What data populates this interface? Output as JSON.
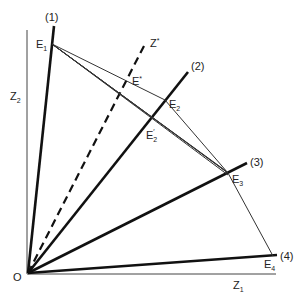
{
  "diagram": {
    "origin_label": "O",
    "axes": {
      "z1_label": "Z",
      "z1_sub": "1",
      "z2_label": "Z",
      "z2_sub": "2"
    },
    "rays": [
      {
        "label": "(1)",
        "end": [
          54,
          26
        ]
      },
      {
        "label": "(2)",
        "end": [
          188,
          72
        ]
      },
      {
        "label": "(3)",
        "end": [
          247,
          163
        ]
      },
      {
        "label": "(4)",
        "end": [
          277,
          255
        ]
      }
    ],
    "dashed_ray": {
      "label": "Z",
      "sup": "*",
      "end": [
        146,
        42
      ]
    },
    "points": {
      "E1": {
        "label": "E",
        "sub": "1",
        "xy": [
          52,
          44
        ]
      },
      "E2": {
        "label": "E",
        "sub": "2",
        "xy": [
          165,
          100
        ]
      },
      "E2prime": {
        "label": "E",
        "sub": "2",
        "prime": "′",
        "xy": [
          147,
          120
        ]
      },
      "E3": {
        "label": "E",
        "sub": "3",
        "xy": [
          228,
          173
        ]
      },
      "E4": {
        "label": "E",
        "sub": "4",
        "xy": [
          273,
          256
        ]
      },
      "Estar": {
        "label": "E",
        "sup": "*",
        "xy": [
          127,
          80
        ]
      }
    },
    "origin": [
      28,
      273
    ],
    "colors": {
      "ink": "#111111",
      "thin": "#333333",
      "background": "#ffffff"
    }
  }
}
